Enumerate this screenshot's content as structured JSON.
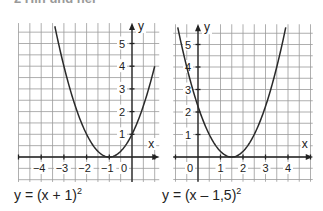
{
  "header": {
    "text": "2 Hin und her"
  },
  "chart_data": [
    {
      "type": "line",
      "title": "",
      "caption": "y = (x + 1)²",
      "function": "(x + 1)^2",
      "xlabel": "x",
      "ylabel": "y",
      "xlim": [
        -5,
        1.2
      ],
      "ylim": [
        -1.1,
        5.9
      ],
      "x_tick_labels": [
        "−4",
        "−3",
        "−2",
        "−1",
        "0"
      ],
      "y_tick_labels": [
        "1",
        "2",
        "3",
        "4",
        "5"
      ],
      "grid": true,
      "grid_step": 0.5,
      "x": [
        -3.4,
        -3,
        -2.5,
        -2,
        -1.5,
        -1,
        -0.5,
        0,
        0.5,
        1.0
      ],
      "values": [
        5.76,
        4,
        2.25,
        1,
        0.25,
        0,
        0.25,
        1,
        2.25,
        4
      ],
      "vertex": [
        -1,
        0
      ]
    },
    {
      "type": "line",
      "title": "",
      "caption": "y = (x – 1,5)²",
      "function": "(x - 1.5)^2",
      "xlabel": "x",
      "ylabel": "y",
      "xlim": [
        -1.1,
        5.1
      ],
      "ylim": [
        -1.1,
        5.9
      ],
      "x_tick_labels": [
        "0",
        "1",
        "2",
        "3",
        "4"
      ],
      "y_tick_labels": [
        "1",
        "2",
        "3",
        "4",
        "5"
      ],
      "grid": true,
      "grid_step": 0.5,
      "x": [
        -0.9,
        -0.5,
        0,
        0.5,
        1,
        1.5,
        2,
        2.5,
        3,
        3.5,
        3.9
      ],
      "values": [
        5.76,
        4,
        2.25,
        1,
        0.25,
        0,
        0.25,
        1,
        2.25,
        4,
        5.76
      ],
      "vertex": [
        1.5,
        0
      ]
    }
  ],
  "captions": {
    "left_prefix": "y = (x + 1)",
    "right_prefix": "y = (x – 1,5)",
    "exponent": "2"
  },
  "colors": {
    "grid": "#9a9a9a",
    "axis": "#222222",
    "curve": "#2a2a2a"
  }
}
